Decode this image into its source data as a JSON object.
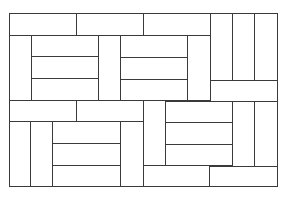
{
  "diagram": {
    "title": "",
    "type": "parquet-tile-pattern",
    "stroke_color": "#3a3a3a",
    "fill_color": "#ffffff",
    "tiles": [
      {
        "x": 9,
        "y": 13,
        "w": 67,
        "h": 22
      },
      {
        "x": 76,
        "y": 13,
        "w": 67,
        "h": 22
      },
      {
        "x": 143,
        "y": 13,
        "w": 67,
        "h": 22
      },
      {
        "x": 210,
        "y": 13,
        "w": 22,
        "h": 67
      },
      {
        "x": 232,
        "y": 13,
        "w": 22,
        "h": 67
      },
      {
        "x": 254,
        "y": 13,
        "w": 23,
        "h": 67
      },
      {
        "x": 9,
        "y": 35,
        "w": 22,
        "h": 65
      },
      {
        "x": 31,
        "y": 35,
        "w": 67,
        "h": 21
      },
      {
        "x": 31,
        "y": 56,
        "w": 67,
        "h": 22
      },
      {
        "x": 31,
        "y": 78,
        "w": 67,
        "h": 22
      },
      {
        "x": 98,
        "y": 35,
        "w": 22,
        "h": 65
      },
      {
        "x": 120,
        "y": 35,
        "w": 67,
        "h": 22
      },
      {
        "x": 120,
        "y": 57,
        "w": 67,
        "h": 22
      },
      {
        "x": 120,
        "y": 79,
        "w": 67,
        "h": 21
      },
      {
        "x": 187,
        "y": 35,
        "w": 23,
        "h": 65
      },
      {
        "x": 210,
        "y": 80,
        "w": 67,
        "h": 21
      },
      {
        "x": 9,
        "y": 100,
        "w": 67,
        "h": 21
      },
      {
        "x": 76,
        "y": 100,
        "w": 67,
        "h": 21
      },
      {
        "x": 143,
        "y": 100,
        "w": 22,
        "h": 65
      },
      {
        "x": 165,
        "y": 101,
        "w": 67,
        "h": 21
      },
      {
        "x": 232,
        "y": 101,
        "w": 22,
        "h": 65
      },
      {
        "x": 254,
        "y": 101,
        "w": 23,
        "h": 65
      },
      {
        "x": 9,
        "y": 121,
        "w": 21,
        "h": 65
      },
      {
        "x": 30,
        "y": 121,
        "w": 22,
        "h": 65
      },
      {
        "x": 52,
        "y": 121,
        "w": 68,
        "h": 22
      },
      {
        "x": 52,
        "y": 143,
        "w": 68,
        "h": 22
      },
      {
        "x": 52,
        "y": 165,
        "w": 68,
        "h": 21
      },
      {
        "x": 120,
        "y": 121,
        "w": 23,
        "h": 65
      },
      {
        "x": 165,
        "y": 122,
        "w": 67,
        "h": 22
      },
      {
        "x": 165,
        "y": 144,
        "w": 67,
        "h": 21
      },
      {
        "x": 143,
        "y": 165,
        "w": 66,
        "h": 21
      },
      {
        "x": 209,
        "y": 166,
        "w": 68,
        "h": 20
      }
    ]
  }
}
